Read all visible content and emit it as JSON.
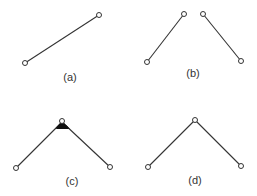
{
  "panels": [
    {
      "id": "a",
      "label": "(a)",
      "description": "single segment between two endpoints"
    },
    {
      "id": "b",
      "label": "(b)",
      "description": "two separate segments, endpoints near but not joined"
    },
    {
      "id": "c",
      "label": "(c)",
      "description": "two segments joined at a shared vertex, vertex highlighted (filled wedge)"
    },
    {
      "id": "d",
      "label": "(d)",
      "description": "two segments joined into a single polyline at a common vertex"
    }
  ],
  "colors": {
    "line": "#333333",
    "vertex_fill": "#ffffff",
    "joint_fill": "#111111",
    "background": "#ffffff"
  }
}
